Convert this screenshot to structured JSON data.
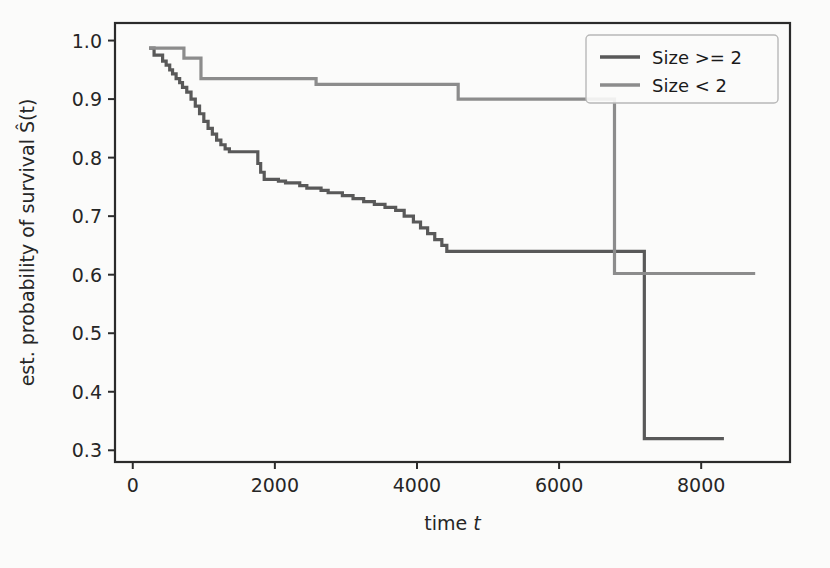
{
  "figure": {
    "background": "#fbfbfa",
    "plot_background": "#fbfbfa"
  },
  "chart_data": {
    "type": "line",
    "subtype": "step-post",
    "title": "",
    "xlabel": "time t",
    "ylabel": "est. probability of survival Ŝ(t)",
    "xlim": [
      -250,
      9250
    ],
    "ylim": [
      0.28,
      1.03
    ],
    "xticks": [
      0,
      2000,
      4000,
      6000,
      8000
    ],
    "xticklabels": [
      "0",
      "2000",
      "4000",
      "6000",
      "8000"
    ],
    "yticks": [
      0.3,
      0.4,
      0.5,
      0.6,
      0.7,
      0.8,
      0.9,
      1.0
    ],
    "yticklabels": [
      "0.3",
      "0.4",
      "0.5",
      "0.6",
      "0.7",
      "0.8",
      "0.9",
      "1.0"
    ],
    "grid": false,
    "legend_position": "upper right",
    "series": [
      {
        "name": "Size >= 2",
        "color": "#595959",
        "x": [
          230,
          300,
          420,
          470,
          520,
          560,
          610,
          660,
          700,
          760,
          820,
          880,
          940,
          1000,
          1060,
          1120,
          1180,
          1240,
          1300,
          1360,
          1720,
          1760,
          1800,
          1850,
          2050,
          2150,
          2350,
          2450,
          2650,
          2750,
          2950,
          3100,
          3250,
          3400,
          3550,
          3700,
          3820,
          3950,
          4050,
          4150,
          4250,
          4350,
          4420,
          7180,
          7200,
          8320
        ],
        "y": [
          0.987,
          0.975,
          0.965,
          0.958,
          0.95,
          0.943,
          0.935,
          0.928,
          0.92,
          0.912,
          0.9,
          0.888,
          0.875,
          0.862,
          0.85,
          0.84,
          0.83,
          0.822,
          0.815,
          0.81,
          0.81,
          0.79,
          0.775,
          0.763,
          0.76,
          0.757,
          0.752,
          0.748,
          0.744,
          0.74,
          0.735,
          0.73,
          0.725,
          0.72,
          0.715,
          0.71,
          0.7,
          0.69,
          0.68,
          0.67,
          0.66,
          0.65,
          0.64,
          0.64,
          0.32,
          0.32
        ]
      },
      {
        "name": "Size < 2",
        "color": "#8c8c8c",
        "x": [
          230,
          680,
          720,
          900,
          960,
          2540,
          2580,
          4540,
          4580,
          6740,
          6780,
          8760
        ],
        "y": [
          0.987,
          0.987,
          0.97,
          0.97,
          0.935,
          0.935,
          0.925,
          0.925,
          0.9,
          0.9,
          0.602,
          0.602
        ]
      }
    ]
  },
  "legend": {
    "entries": [
      {
        "label": "Size >= 2",
        "color": "#595959"
      },
      {
        "label": "Size < 2",
        "color": "#8c8c8c"
      }
    ]
  }
}
